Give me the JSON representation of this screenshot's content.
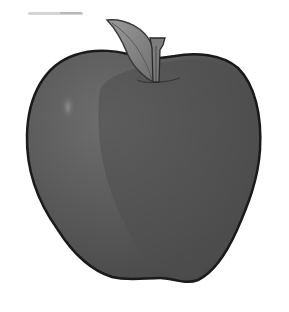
{
  "image": {
    "subject": "apple",
    "description": "Grayscale illustration of an apple with a leaf and stem",
    "colors": {
      "background": "#ffffff",
      "body_dark": "#4a4a4a",
      "body_mid": "#5a5a5a",
      "body_light": "#707070",
      "outline": "#1a1a1a",
      "leaf": "#8c8c8c",
      "leaf_dark": "#6a6a6a",
      "stem": "#7a7a7a",
      "highlight": "#8a8a8a",
      "smudge": "#d8d8d8"
    }
  }
}
